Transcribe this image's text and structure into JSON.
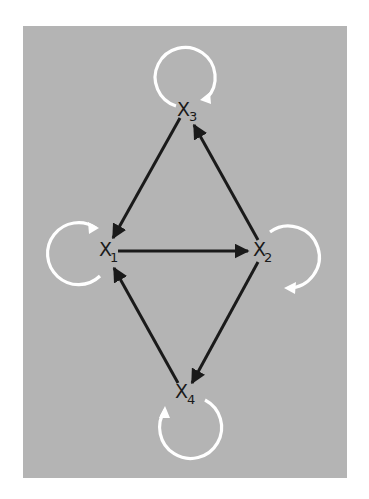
{
  "diagram": {
    "type": "directed-graph",
    "background_color": "#b4b4b4",
    "edge_color": "#1a1a1a",
    "loop_color": "#ffffff",
    "nodes": [
      {
        "id": "X1",
        "letter": "X",
        "subscript": "1"
      },
      {
        "id": "X2",
        "letter": "X",
        "subscript": "2"
      },
      {
        "id": "X3",
        "letter": "X",
        "subscript": "3"
      },
      {
        "id": "X4",
        "letter": "X",
        "subscript": "4"
      }
    ],
    "edges": [
      {
        "from": "X3",
        "to": "X1"
      },
      {
        "from": "X2",
        "to": "X3"
      },
      {
        "from": "X1",
        "to": "X2"
      },
      {
        "from": "X2",
        "to": "X4"
      },
      {
        "from": "X4",
        "to": "X1"
      }
    ],
    "self_loops": [
      {
        "node": "X1",
        "direction": "clockwise"
      },
      {
        "node": "X2",
        "direction": "clockwise"
      },
      {
        "node": "X3",
        "direction": "clockwise"
      },
      {
        "node": "X4",
        "direction": "clockwise"
      }
    ]
  }
}
